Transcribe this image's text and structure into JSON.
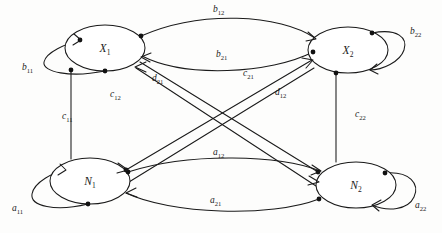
{
  "diagram": {
    "background_color": "#fdfdfc",
    "stroke_color": "#1a1a1a",
    "nodes": [
      {
        "id": "X1",
        "base": "X",
        "subscript": "1",
        "cx": 105,
        "cy": 48,
        "rx": 40,
        "ry": 23
      },
      {
        "id": "X2",
        "base": "X",
        "subscript": "2",
        "cx": 348,
        "cy": 50,
        "rx": 40,
        "ry": 23
      },
      {
        "id": "N1",
        "base": "N",
        "subscript": "1",
        "cx": 90,
        "cy": 181,
        "rx": 40,
        "ry": 23
      },
      {
        "id": "N2",
        "base": "N",
        "subscript": "2",
        "cx": 356,
        "cy": 185,
        "rx": 40,
        "ry": 23
      }
    ],
    "edges": [
      {
        "id": "b11",
        "base": "b",
        "subscript": "11",
        "from": "X1",
        "to": "X1",
        "kind": "self-loop",
        "label_x": 22,
        "label_y": 70
      },
      {
        "id": "b22",
        "base": "b",
        "subscript": "22",
        "from": "X2",
        "to": "X2",
        "kind": "self-loop",
        "label_x": 410,
        "label_y": 34
      },
      {
        "id": "a11",
        "base": "a",
        "subscript": "11",
        "from": "N1",
        "to": "N1",
        "kind": "self-loop",
        "label_x": 12,
        "label_y": 211
      },
      {
        "id": "a22",
        "base": "a",
        "subscript": "22",
        "from": "N2",
        "to": "N2",
        "kind": "self-loop",
        "label_x": 415,
        "label_y": 208
      },
      {
        "id": "b12",
        "base": "b",
        "subscript": "12",
        "from": "X1",
        "to": "X2",
        "kind": "curve",
        "label_x": 213,
        "label_y": 12
      },
      {
        "id": "b21",
        "base": "b",
        "subscript": "21",
        "from": "X2",
        "to": "X1",
        "kind": "curve",
        "label_x": 216,
        "label_y": 57
      },
      {
        "id": "a12",
        "base": "a",
        "subscript": "12",
        "from": "N1",
        "to": "N2",
        "kind": "curve",
        "label_x": 213,
        "label_y": 155
      },
      {
        "id": "a21",
        "base": "a",
        "subscript": "21",
        "from": "N2",
        "to": "N1",
        "kind": "curve",
        "label_x": 210,
        "label_y": 203
      },
      {
        "id": "c11",
        "base": "c",
        "subscript": "11",
        "from": "X1",
        "to": "N1",
        "kind": "straight",
        "label_x": 62,
        "label_y": 119
      },
      {
        "id": "c22",
        "base": "c",
        "subscript": "22",
        "from": "X2",
        "to": "N2",
        "kind": "straight",
        "label_x": 355,
        "label_y": 117
      },
      {
        "id": "d21",
        "base": "d",
        "subscript": "21",
        "from": "N2",
        "to": "X1",
        "kind": "diagonal",
        "label_x": 152,
        "label_y": 81
      },
      {
        "id": "c12",
        "base": "c",
        "subscript": "12",
        "from": "N2",
        "to": "X1",
        "kind": "diagonal",
        "label_x": 110,
        "label_y": 97
      },
      {
        "id": "c21",
        "base": "c",
        "subscript": "21",
        "from": "N1",
        "to": "X2",
        "kind": "diagonal",
        "label_x": 243,
        "label_y": 76
      },
      {
        "id": "d12",
        "base": "d",
        "subscript": "12",
        "from": "N1",
        "to": "X2",
        "kind": "diagonal",
        "label_x": 275,
        "label_y": 95
      }
    ]
  }
}
